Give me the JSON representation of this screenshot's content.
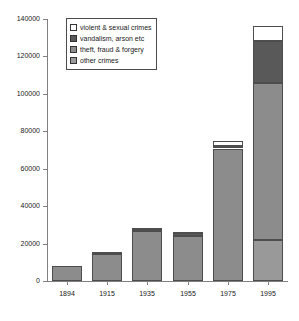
{
  "chart_data": {
    "type": "bar",
    "stacked": true,
    "title": "",
    "subtitle": "",
    "xlabel": "",
    "ylabel": "",
    "categories": [
      "1894",
      "1915",
      "1935",
      "1955",
      "1975",
      "1995"
    ],
    "ylim": [
      0,
      140000
    ],
    "ytick_values": [
      0,
      20000,
      40000,
      60000,
      80000,
      100000,
      120000,
      140000
    ],
    "ytick_labels": [
      "0",
      "20000",
      "40000",
      "60000",
      "80000",
      "100000",
      "120000",
      "140000"
    ],
    "grid": false,
    "legend_position": "upper-left-inside",
    "series": [
      {
        "name": "violent & sexual crimes",
        "color": "#ffffff",
        "values": [
          0,
          700,
          1400,
          300,
          3000,
          8500
        ]
      },
      {
        "name": "vandalism, arson etc",
        "color": "#595959",
        "values": [
          0,
          300,
          400,
          1500,
          1200,
          22000
        ]
      },
      {
        "name": "theft, fraud & forgery",
        "color": "#8c8c8c",
        "values": [
          8000,
          14500,
          26700,
          24200,
          70800,
          84000
        ]
      },
      {
        "name": "other crimes",
        "color": "#999999",
        "values": [
          0,
          0,
          0,
          0,
          0,
          22000
        ]
      }
    ],
    "totals": [
      8000,
      15500,
      28500,
      26000,
      75000,
      136500
    ],
    "legend_entries": [
      "violent & sexual crimes",
      "vandalism, arson etc",
      "theft, fraud & forgery",
      "other crimes"
    ]
  },
  "style": {
    "axis_color": "#808080",
    "bar_edge_color": "#4d4d4d",
    "text_color": "#1a1a1a",
    "background": "#ffffff"
  }
}
